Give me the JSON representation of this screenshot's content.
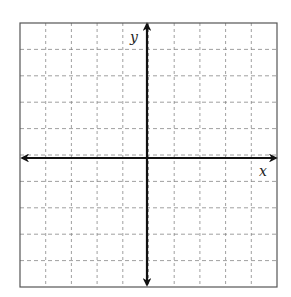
{
  "diagram": {
    "type": "coordinate-grid",
    "grid": {
      "columns": 10,
      "rows": 10,
      "line_style": "dashed",
      "line_color": "#888888",
      "border_color": "#555555"
    },
    "axes": {
      "x_label": "x",
      "y_label": "y",
      "color": "#111111",
      "arrows": "both-ends"
    }
  }
}
